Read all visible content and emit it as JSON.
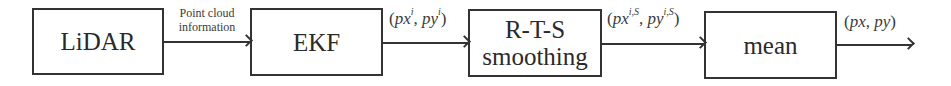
{
  "diagram": {
    "type": "flowchart",
    "direction": "left-to-right",
    "nodes": [
      {
        "id": "lidar",
        "label": "LiDAR"
      },
      {
        "id": "ekf",
        "label": "EKF"
      },
      {
        "id": "rts",
        "label_line1": "R-T-S",
        "label_line2": "smoothing"
      },
      {
        "id": "mean",
        "label": "mean"
      }
    ],
    "edges": [
      {
        "from": "lidar",
        "to": "ekf",
        "label_line1": "Point cloud",
        "label_line2": "information"
      },
      {
        "from": "ekf",
        "to": "rts",
        "label": {
          "open": "(",
          "a": "px",
          "a_sup": "i",
          "sep": ", ",
          "b": "py",
          "b_sup": "i",
          "close": ")"
        }
      },
      {
        "from": "rts",
        "to": "mean",
        "label": {
          "open": "(",
          "a": "px",
          "a_sup": "i,S",
          "sep": ", ",
          "b": "py",
          "b_sup": "i,S",
          "close": ")"
        }
      },
      {
        "from": "mean",
        "to": "output",
        "label": {
          "open": "(",
          "a": "px",
          "sep": ", ",
          "b": "py",
          "close": ")"
        }
      }
    ],
    "colors": {
      "stroke": "#333333",
      "text": "#2a2a2a",
      "background": "#ffffff"
    }
  }
}
